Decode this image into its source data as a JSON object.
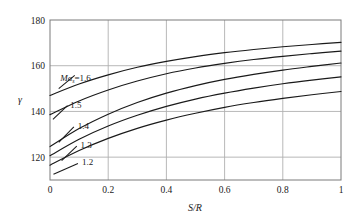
{
  "chart_data": {
    "type": "line",
    "title": "",
    "xlabel": "S/R",
    "ylabel": "γ",
    "xlim": [
      0,
      1
    ],
    "ylim": [
      110,
      180
    ],
    "grid": true,
    "legend_position": "inline-left",
    "x_ticks": [
      "0",
      "0.2",
      "0.4",
      "0.6",
      "0.8",
      "1"
    ],
    "x_tick_values": [
      0,
      0.2,
      0.4,
      0.6,
      0.8,
      1
    ],
    "y_ticks": [
      "120",
      "140",
      "160",
      "180"
    ],
    "y_tick_values": [
      120,
      140,
      160,
      180
    ],
    "x": [
      0,
      0.1,
      0.2,
      0.3,
      0.4,
      0.5,
      0.6,
      0.7,
      0.8,
      0.9,
      1.0
    ],
    "series": [
      {
        "name": "Maₛ=1.6",
        "label": "1.6",
        "prefix": "Ma",
        "subscript": "s",
        "equals": "=",
        "color": "#1a1a1a",
        "values": [
          147.0,
          152.0,
          156.0,
          159.3,
          161.9,
          164.0,
          165.7,
          167.1,
          168.3,
          169.3,
          170.2
        ]
      },
      {
        "name": "Maₛ=1.5",
        "label": "1.5",
        "color": "#1a1a1a",
        "values": [
          138.6,
          144.6,
          149.4,
          153.3,
          156.5,
          159.0,
          161.0,
          162.7,
          164.1,
          165.3,
          166.4
        ]
      },
      {
        "name": "Maₛ=1.4",
        "label": "1.4",
        "color": "#1a1a1a",
        "values": [
          124.6,
          132.5,
          138.8,
          143.9,
          148.0,
          151.3,
          154.0,
          156.2,
          158.1,
          159.7,
          161.2
        ]
      },
      {
        "name": "Maₛ=1.3",
        "label": "1.3",
        "color": "#1a1a1a",
        "values": [
          120.6,
          127.8,
          133.6,
          138.3,
          142.2,
          145.4,
          148.0,
          150.2,
          152.1,
          153.7,
          155.1
        ]
      },
      {
        "name": "Maₛ=1.2",
        "label": "1.2",
        "color": "#1a1a1a",
        "values": [
          116.5,
          122.9,
          128.2,
          132.6,
          136.2,
          139.2,
          141.8,
          143.9,
          145.7,
          147.3,
          148.7
        ]
      }
    ]
  },
  "axes": {
    "x_title": "S/R",
    "y_title": "γ"
  },
  "style": {
    "curve_color": "#1a1a1a",
    "grid_color": "#b0b0b0",
    "frame_color": "#7a7a7a",
    "background": "#ffffff"
  }
}
